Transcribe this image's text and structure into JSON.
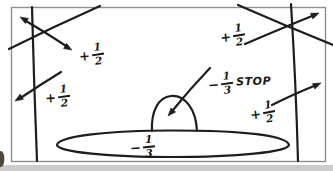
{
  "figure_labels": {
    "top_left_spin": {
      "sign": "+",
      "numerator": "1",
      "denominator": "2"
    },
    "top_right_spin": {
      "sign": "+",
      "numerator": "1",
      "denominator": "2"
    },
    "mid_left_spin": {
      "sign": "+",
      "numerator": "1",
      "denominator": "2"
    },
    "mid_right_spin": {
      "sign": "+",
      "numerator": "1",
      "denominator": "2"
    },
    "dome_charge": {
      "sign": "−",
      "numerator": "1",
      "denominator": "3",
      "suffix": "STOP"
    },
    "platform_charge": {
      "sign": "−",
      "numerator": "1",
      "denominator": "3"
    }
  },
  "colors": {
    "ink": "#1d1d1d",
    "frame": "#8f8f8f",
    "bottom_strip": "#cccccc",
    "background": "#ffffff"
  }
}
